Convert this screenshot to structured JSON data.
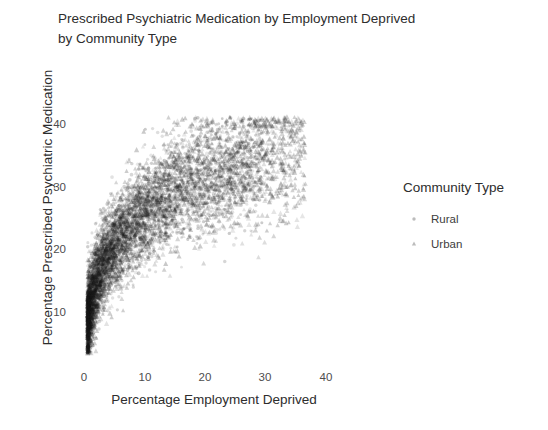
{
  "chart_data": {
    "type": "scatter",
    "title": "Prescribed Psychiatric Medication by Employment Deprived by Community Type",
    "title_lines": [
      "Prescribed Psychiatric Medication by Employment Deprived",
      "by Community Type"
    ],
    "xlabel": "Percentage Employment Deprived",
    "ylabel": "Percentage Prescribed Psychiatric Medication",
    "xticks": [
      0,
      10,
      20,
      30,
      40
    ],
    "xtick_labels": [
      "0",
      "10",
      "20",
      "30",
      "40"
    ],
    "yticks": [
      10,
      20,
      30,
      40
    ],
    "ytick_labels": [
      "10",
      "20",
      "30",
      "40"
    ],
    "xlim": [
      -2.5,
      50.0
    ],
    "ylim": [
      2.0,
      45.0
    ],
    "grid": false,
    "legend": {
      "title": "Community Type",
      "position": "right",
      "entries": [
        {
          "name": "Rural",
          "marker": "circle",
          "color": "#4d4d4d"
        },
        {
          "name": "Urban",
          "marker": "triangle",
          "color": "#4d4d4d"
        }
      ]
    },
    "point_color": "#1a1a1a",
    "point_alpha": 0.18,
    "point_size": 2.4,
    "n_points_total": 6500,
    "series": [
      {
        "name": "Rural",
        "marker": "circle",
        "n": 2600,
        "x_range": [
          0.0,
          32.0
        ],
        "y_range": [
          4.0,
          36.0
        ],
        "description": "Positive curvilinear relationship; dense cluster at low employment deprivation, spreading upward and right."
      },
      {
        "name": "Urban",
        "marker": "triangle",
        "n": 3900,
        "x_range": [
          0.0,
          40.0
        ],
        "y_range": [
          4.0,
          36.0
        ],
        "description": "Positive curvilinear relationship; heavy overplotting near origin, thinning toward upper right."
      }
    ],
    "relationship": "Strong positive, concave-down (log-like) association between percentage employment deprived and percentage prescribed psychiatric medication.",
    "annotations": []
  }
}
